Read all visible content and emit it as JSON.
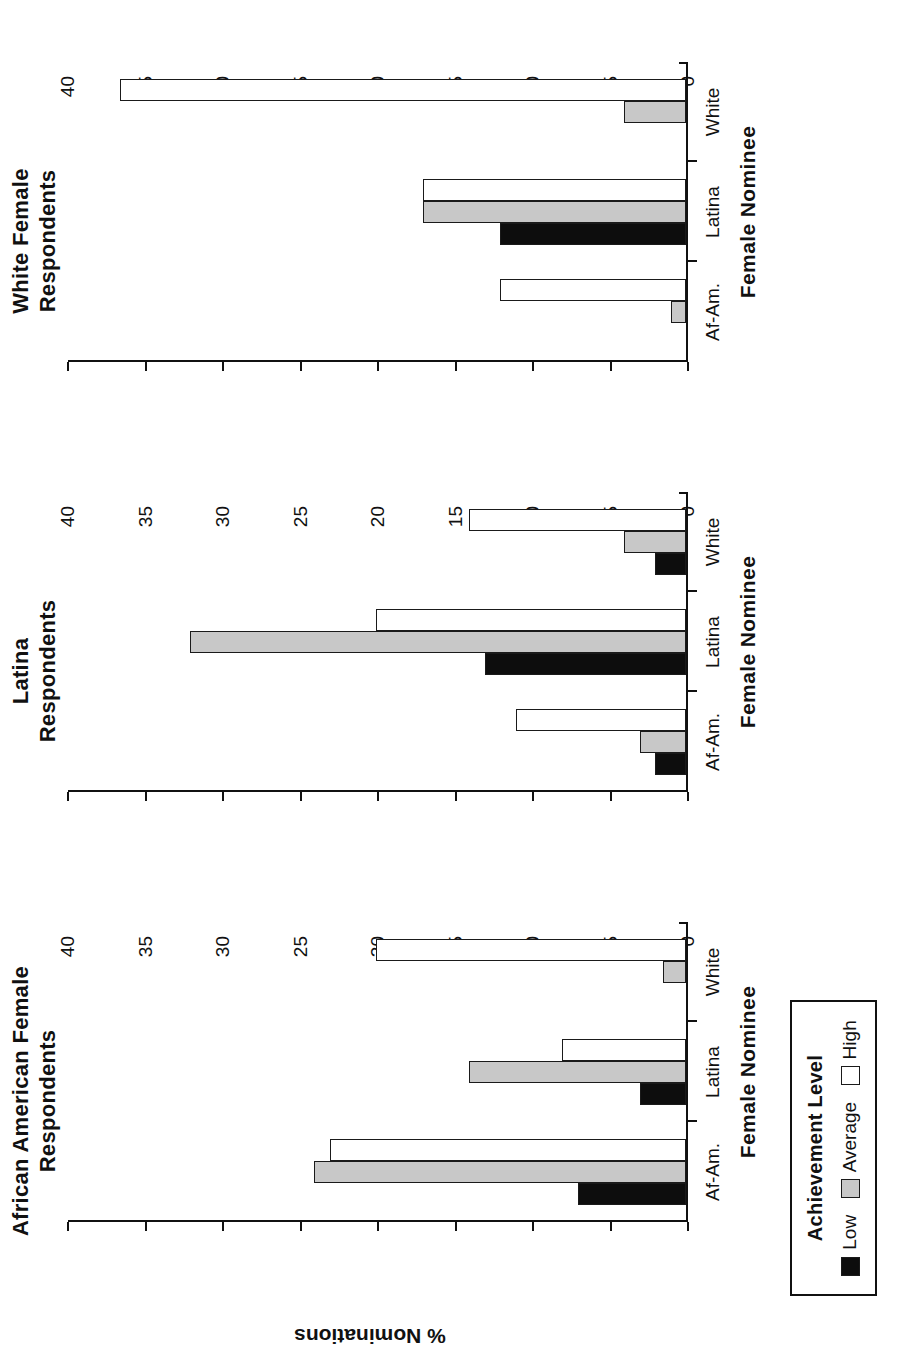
{
  "chart_data": {
    "type": "bar",
    "title": "",
    "orientation": "rotated-90-ccw",
    "xlabel": "Female Nominee",
    "ylabel": "% Nominations",
    "ylim": [
      0,
      40
    ],
    "yticks": [
      0,
      5,
      10,
      15,
      20,
      25,
      30,
      35,
      40
    ],
    "ytick_labels": [
      "0",
      "5",
      "10",
      "15",
      "20",
      "25",
      "30",
      "35",
      "40"
    ],
    "grid": false,
    "categories": [
      "Af-Am.",
      "Latina",
      "White"
    ],
    "legend": {
      "title": "Achievement Level",
      "position": "below-first-panel",
      "entries": [
        {
          "name": "Low",
          "color": "#0d0d0d"
        },
        {
          "name": "Average",
          "color": "#c8c8c8"
        },
        {
          "name": "High",
          "color": "#ffffff"
        }
      ]
    },
    "panels": [
      {
        "title": "African American Female\nRespondents",
        "series": [
          {
            "name": "Low",
            "values": [
              7,
              3,
              0
            ]
          },
          {
            "name": "Average",
            "values": [
              24,
              14,
              1.5
            ]
          },
          {
            "name": "High",
            "values": [
              23,
              8,
              20
            ]
          }
        ]
      },
      {
        "title": "Latina\nRespondents",
        "series": [
          {
            "name": "Low",
            "values": [
              2,
              13,
              2
            ]
          },
          {
            "name": "Average",
            "values": [
              3,
              32,
              4
            ]
          },
          {
            "name": "High",
            "values": [
              11,
              20,
              14
            ]
          }
        ]
      },
      {
        "title": "White Female\nRespondents",
        "series": [
          {
            "name": "Low",
            "values": [
              0,
              12,
              0
            ]
          },
          {
            "name": "Average",
            "values": [
              1,
              17,
              4
            ]
          },
          {
            "name": "High",
            "values": [
              12,
              17,
              36.5
            ]
          }
        ]
      }
    ]
  },
  "panel_titles": [
    "African American Female\nRespondents",
    "Latina\nRespondents",
    "White Female\nRespondents"
  ],
  "axis": {
    "x_title": "Female Nominee",
    "y_title": "% Nominations",
    "category_labels": [
      "Af-Am.",
      "Latina",
      "White"
    ],
    "value_labels": [
      "0",
      "5",
      "10",
      "15",
      "20",
      "25",
      "30",
      "35",
      "40"
    ]
  },
  "legend": {
    "title": "Achievement Level",
    "low_label": "Low",
    "average_label": "Average",
    "high_label": "High"
  }
}
